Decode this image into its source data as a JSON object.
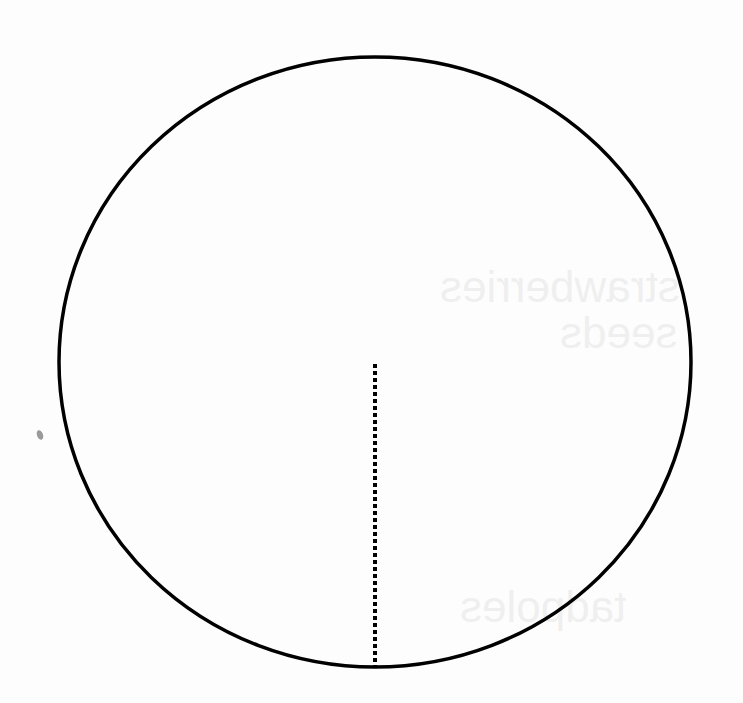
{
  "diagram": {
    "type": "geometry",
    "circle": {
      "cx": 375,
      "cy": 362,
      "rx": 316,
      "ry": 305,
      "stroke": "#000000",
      "stroke_width": 3.5,
      "fill": "none"
    },
    "radius_line": {
      "x1": 375,
      "y1": 364,
      "x2": 375,
      "y2": 667,
      "style": "dotted",
      "stroke": "#000000",
      "stroke_width": 4
    },
    "speck": {
      "cx": 40,
      "cy": 435,
      "color": "#9a9a9a"
    }
  },
  "bleed_through": {
    "line_1": "strawberries",
    "line_2": "seeds",
    "line_3": "tadpoles"
  }
}
